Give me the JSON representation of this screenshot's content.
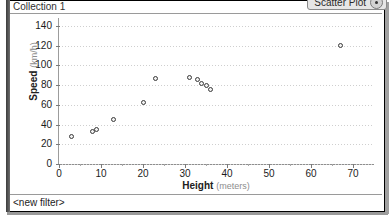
{
  "window": {
    "title": "Collection 1",
    "filter_label": "<new filter>"
  },
  "toolbar": {
    "plot_type_label": "Scatter Plot",
    "plot_type_icon": "radio-dot-icon"
  },
  "chart_data": {
    "type": "scatter",
    "title": "",
    "xlabel": "Height",
    "xunit": "(meters)",
    "ylabel": "Speed",
    "yunit": "(km/h)",
    "xlim": [
      0,
      75
    ],
    "ylim": [
      0,
      148
    ],
    "xticks": [
      0,
      10,
      20,
      30,
      40,
      50,
      60,
      70
    ],
    "yticks": [
      0,
      20,
      40,
      60,
      80,
      100,
      120,
      140
    ],
    "grid": true,
    "legend": false,
    "points": [
      {
        "x": 3,
        "y": 28
      },
      {
        "x": 8,
        "y": 33
      },
      {
        "x": 9,
        "y": 35
      },
      {
        "x": 13,
        "y": 45
      },
      {
        "x": 20,
        "y": 62
      },
      {
        "x": 23,
        "y": 87
      },
      {
        "x": 31,
        "y": 88
      },
      {
        "x": 33,
        "y": 86
      },
      {
        "x": 34,
        "y": 82
      },
      {
        "x": 35,
        "y": 80
      },
      {
        "x": 36,
        "y": 76
      },
      {
        "x": 67,
        "y": 120
      }
    ],
    "marker_color": "#3a3a3a"
  }
}
